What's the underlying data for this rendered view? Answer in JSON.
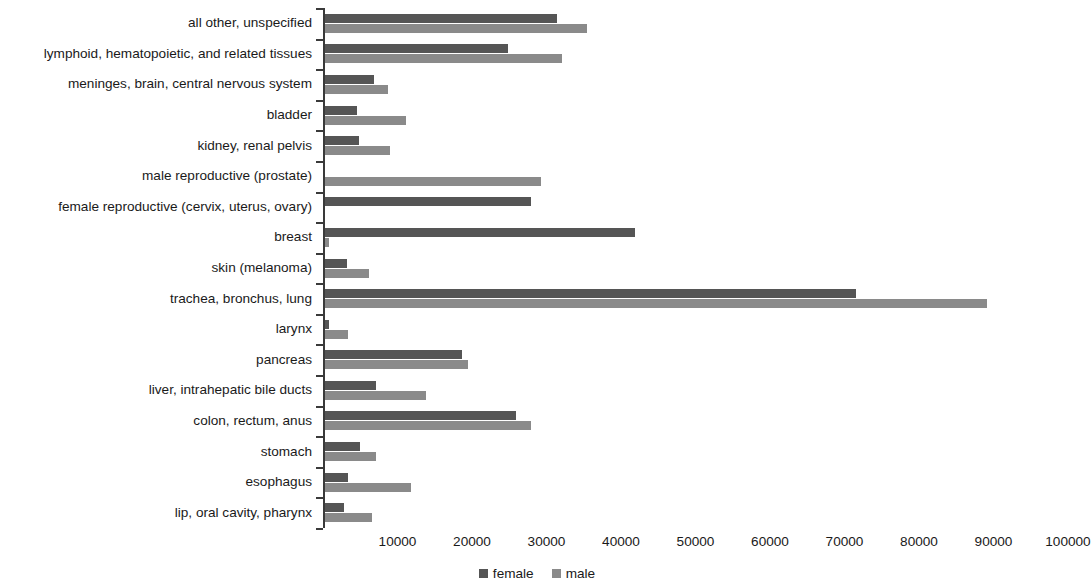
{
  "chart_data": {
    "type": "bar",
    "orientation": "horizontal",
    "title": "",
    "xlabel": "",
    "ylabel": "",
    "xlim": [
      0,
      100000
    ],
    "xticks": [
      10000,
      20000,
      30000,
      40000,
      50000,
      60000,
      70000,
      80000,
      90000,
      100000
    ],
    "xtick_labels": [
      "10000",
      "20000",
      "30000",
      "40000",
      "50000",
      "60000",
      "70000",
      "80000",
      "90000",
      "100000"
    ],
    "grid": false,
    "legend_position": "bottom",
    "colors": {
      "female": "#555555",
      "male": "#8a8a8a",
      "axis": "#3a3a3a",
      "text": "#1a1a1a",
      "background": "#ffffff"
    },
    "categories": [
      "all other, unspecified",
      "lymphoid, hematopoietic, and related tissues",
      "meninges, brain, central nervous system",
      "bladder",
      "kidney, renal pelvis",
      "male reproductive (prostate)",
      "female reproductive (cervix, uterus, ovary)",
      "breast",
      "skin (melanoma)",
      "trachea, bronchus, lung",
      "larynx",
      "pancreas",
      "liver, intrahepatic bile ducts",
      "colon, rectum, anus",
      "stomach",
      "esophagus",
      "lip, oral cavity, pharynx"
    ],
    "series": [
      {
        "name": "female",
        "values": [
          31100,
          24500,
          6600,
          4250,
          4550,
          0,
          27600,
          41600,
          2900,
          71300,
          500,
          18400,
          6900,
          25700,
          4700,
          3100,
          2600
        ]
      },
      {
        "name": "male",
        "values": [
          35200,
          31800,
          8450,
          10850,
          8750,
          29000,
          0,
          500,
          5900,
          88800,
          3100,
          19200,
          13600,
          27600,
          6900,
          11500,
          6350
        ]
      }
    ]
  },
  "legend": {
    "items": [
      {
        "label": "female",
        "key": "female"
      },
      {
        "label": "male",
        "key": "male"
      }
    ]
  }
}
